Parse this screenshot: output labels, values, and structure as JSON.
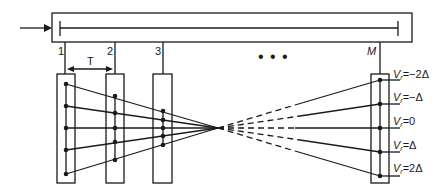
{
  "diagram": {
    "input_arrow": "input-arrow",
    "delay_line": {
      "label": ""
    },
    "taps": [
      {
        "label": "1",
        "x": 65
      },
      {
        "label": "2",
        "x": 115
      },
      {
        "label": "3",
        "x": 163
      },
      {
        "label": "M",
        "x": 380,
        "italic": true
      }
    ],
    "ellipsis": "• • •",
    "spacing_label": "T",
    "velocity_labels": [
      {
        "v": "V",
        "sub": "r",
        "eq": "=−2Δ"
      },
      {
        "v": "V",
        "sub": "r",
        "eq": "=−Δ"
      },
      {
        "v": "V",
        "sub": "r",
        "eq": "=0"
      },
      {
        "v": "V",
        "sub": "r",
        "eq": "=Δ"
      },
      {
        "v": "V",
        "sub": "r",
        "eq": "=2Δ"
      }
    ],
    "colors": {
      "stroke": "#1a1a1a",
      "background": "#ffffff"
    }
  }
}
